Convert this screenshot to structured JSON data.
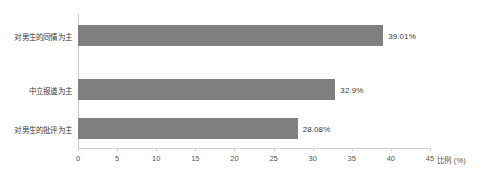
{
  "chart_data": {
    "type": "bar",
    "orientation": "horizontal",
    "title": "",
    "subtitle": "",
    "xlabel": "比例 (%)",
    "ylabel": "",
    "categories": [
      "对男生的同情为主",
      "中立报道为主",
      "对男生的批评为主"
    ],
    "values": [
      39.01,
      32.9,
      28.08
    ],
    "value_labels": [
      "39.01%",
      "32.9%",
      "28.08%"
    ],
    "series": [
      {
        "name": "比例",
        "values": [
          39.01,
          32.9,
          28.08
        ]
      }
    ],
    "xlim": [
      0,
      45
    ],
    "xticks": [
      0,
      5,
      10,
      15,
      20,
      25,
      30,
      35,
      40,
      45
    ],
    "xtick_labels": [
      "0",
      "5",
      "10",
      "15",
      "20",
      "25",
      "30",
      "35",
      "40",
      "45"
    ],
    "grid": false,
    "legend": false,
    "legend_position": "none",
    "bar_color": "#7f7f7f",
    "axis_color": "#cfcfcf",
    "text_color": "#3a3a3a",
    "background": "#ffffff"
  }
}
